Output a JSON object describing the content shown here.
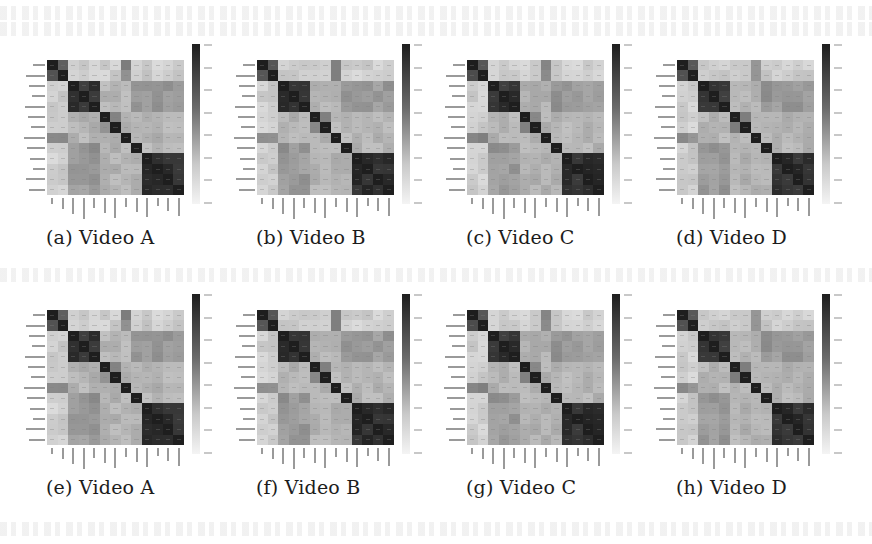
{
  "figure": {
    "panels": [
      {
        "id": "a",
        "caption": "(a) Video A",
        "row": 0,
        "col": 0
      },
      {
        "id": "b",
        "caption": "(b) Video B",
        "row": 0,
        "col": 1
      },
      {
        "id": "c",
        "caption": "(c) Video C",
        "row": 0,
        "col": 2
      },
      {
        "id": "d",
        "caption": "(d) Video D",
        "row": 0,
        "col": 3
      },
      {
        "id": "e",
        "caption": "(e) Video A",
        "row": 1,
        "col": 0
      },
      {
        "id": "f",
        "caption": "(f) Video B",
        "row": 1,
        "col": 1
      },
      {
        "id": "g",
        "caption": "(g) Video C",
        "row": 1,
        "col": 2
      },
      {
        "id": "h",
        "caption": "(h) Video D",
        "row": 1,
        "col": 3
      }
    ]
  },
  "chart_data": [
    {
      "type": "heatmap",
      "title": "(a) Video A",
      "size": 13,
      "colormap": "grayscale (dark = high)",
      "variant": 0
    },
    {
      "type": "heatmap",
      "title": "(b) Video B",
      "size": 13,
      "colormap": "grayscale (dark = high)",
      "variant": 1
    },
    {
      "type": "heatmap",
      "title": "(c) Video C",
      "size": 13,
      "colormap": "grayscale (dark = high)",
      "variant": 2
    },
    {
      "type": "heatmap",
      "title": "(d) Video D",
      "size": 13,
      "colormap": "grayscale (dark = high)",
      "variant": 3
    },
    {
      "type": "heatmap",
      "title": "(e) Video A",
      "size": 13,
      "colormap": "grayscale (dark = high)",
      "variant": 0
    },
    {
      "type": "heatmap",
      "title": "(f) Video B",
      "size": 13,
      "colormap": "grayscale (dark = high)",
      "variant": 1
    },
    {
      "type": "heatmap",
      "title": "(g) Video C",
      "size": 13,
      "colormap": "grayscale (dark = high)",
      "variant": 2
    },
    {
      "type": "heatmap",
      "title": "(h) Video D",
      "size": 13,
      "colormap": "grayscale (dark = high)",
      "variant": 3
    }
  ],
  "matrix_blocks": {
    "description": "Approximate block structure (intensity 0=white .. 1=black), common to all panels",
    "groups": [
      [
        0,
        1
      ],
      [
        2,
        3,
        4
      ],
      [
        5
      ],
      [
        6
      ],
      [
        7
      ],
      [
        8
      ],
      [
        9,
        10,
        11,
        12
      ]
    ],
    "within": [
      0.75,
      0.9,
      1.0,
      1.0,
      1.0,
      1.0,
      0.92
    ],
    "diag": 1.0,
    "between_default": 0.3
  }
}
